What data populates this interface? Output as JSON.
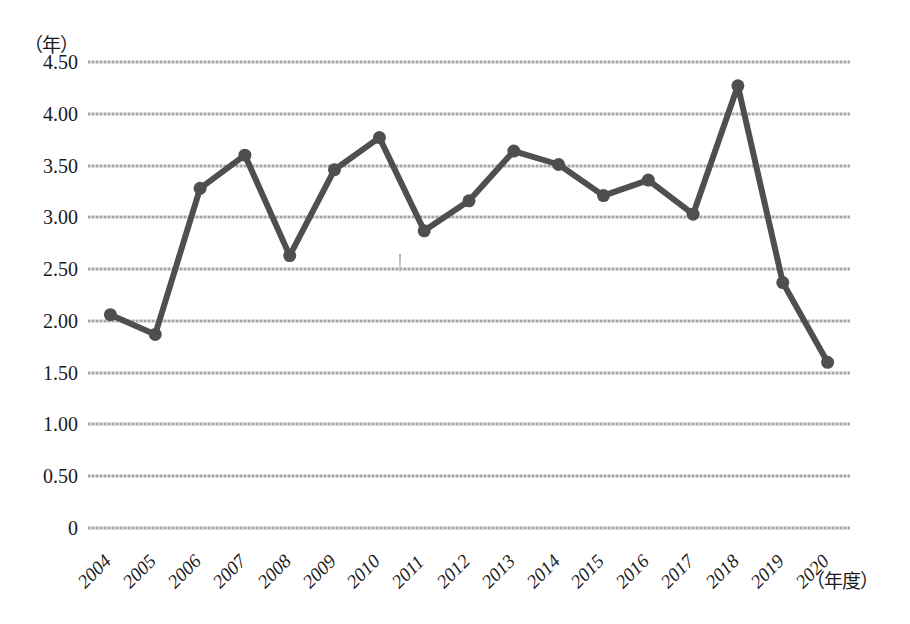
{
  "chart_data": {
    "type": "line",
    "title": "",
    "xlabel": "（年度）",
    "ylabel": "（年）",
    "categories": [
      "2004",
      "2005",
      "2006",
      "2007",
      "2008",
      "2009",
      "2010",
      "2011",
      "2012",
      "2013",
      "2014",
      "2015",
      "2016",
      "2017",
      "2018",
      "2019",
      "2020"
    ],
    "values": [
      2.06,
      1.87,
      3.28,
      3.6,
      2.63,
      3.46,
      3.77,
      2.87,
      3.16,
      3.64,
      3.51,
      3.21,
      3.36,
      3.03,
      4.27,
      2.37,
      1.6
    ],
    "series": [
      {
        "name": "",
        "values": [
          2.06,
          1.87,
          3.28,
          3.6,
          2.63,
          3.46,
          3.77,
          2.87,
          3.16,
          3.64,
          3.51,
          3.21,
          3.36,
          3.03,
          4.27,
          2.37,
          1.6
        ]
      }
    ],
    "ylim": [
      0,
      4.5
    ],
    "yticks": [
      0,
      0.5,
      1.0,
      1.5,
      2.0,
      2.5,
      3.0,
      3.5,
      4.0,
      4.5
    ],
    "ytick_labels": [
      "0",
      "0.50",
      "1.00",
      "1.50",
      "2.00",
      "2.50",
      "3.00",
      "3.50",
      "4.00",
      "4.50"
    ],
    "grid": true,
    "grid_axis": "y",
    "legend": "none",
    "marker": "circle",
    "line_color": "#4f4f4f",
    "marker_color": "#4f4f4f",
    "grid_color": "#a8a8aa",
    "background_color": "#ffffff"
  }
}
